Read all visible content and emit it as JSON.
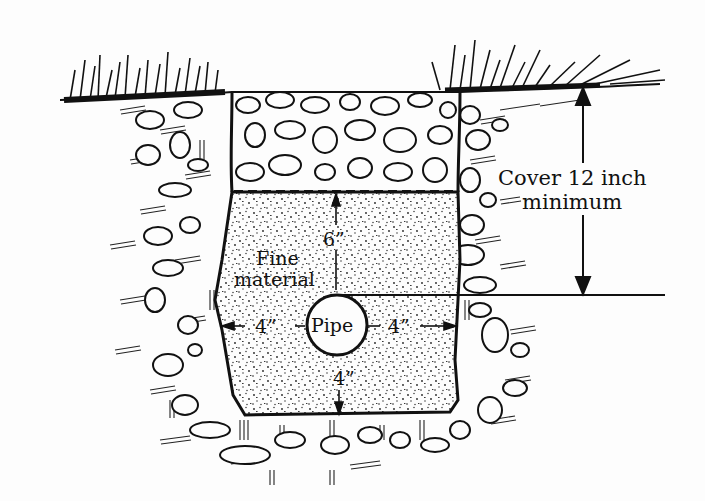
{
  "diagram": {
    "type": "trench-cross-section",
    "labels": {
      "cover_line1": "Cover 12 inch",
      "cover_line2": "minimum",
      "fine_line1": "Fine",
      "fine_line2": "material",
      "pipe": "Pipe",
      "dim_top": "6”",
      "dim_left": "4”",
      "dim_right": "4”",
      "dim_bottom": "4”"
    },
    "colors": {
      "ink": "#111111",
      "paper": "#fdfdfd"
    }
  }
}
